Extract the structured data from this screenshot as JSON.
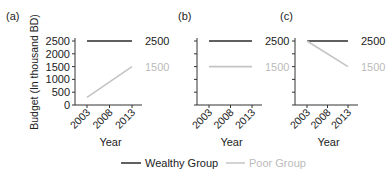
{
  "figure": {
    "ylabel": "Budget (In thousand BD)",
    "xlabel": "Year",
    "legend": {
      "items": [
        {
          "label": "Wealthy Group",
          "color": "#2b2b2b"
        },
        {
          "label": "Poor Group",
          "color": "#c4c4c4"
        }
      ]
    }
  },
  "chart_data": [
    {
      "type": "line",
      "panel_label": "(a)",
      "x": [
        2003,
        2008,
        2013
      ],
      "xticks": [
        "2003",
        "2008",
        "2013"
      ],
      "xlabel": "Year",
      "ylabel": "Budget (In thousand BD)",
      "yticks": [
        "0",
        "500",
        "1000",
        "1500",
        "2000",
        "2500"
      ],
      "ylim": [
        0,
        2500
      ],
      "series": [
        {
          "name": "Wealthy Group",
          "color": "#2b2b2b",
          "x": [
            2003,
            2013
          ],
          "values": [
            2500,
            2500
          ],
          "end_label": "2500"
        },
        {
          "name": "Poor Group",
          "color": "#c4c4c4",
          "x": [
            2003,
            2013
          ],
          "values": [
            300,
            1500
          ],
          "end_label": "1500"
        }
      ],
      "grid": false
    },
    {
      "type": "line",
      "panel_label": "(b)",
      "x": [
        2003,
        2008,
        2013
      ],
      "xticks": [
        "2003",
        "2008",
        "2013"
      ],
      "xlabel": "Year",
      "ylim": [
        0,
        2500
      ],
      "series": [
        {
          "name": "Wealthy Group",
          "color": "#2b2b2b",
          "x": [
            2003,
            2013
          ],
          "values": [
            2500,
            2500
          ],
          "end_label": "2500"
        },
        {
          "name": "Poor Group",
          "color": "#c4c4c4",
          "x": [
            2003,
            2013
          ],
          "values": [
            1500,
            1500
          ],
          "end_label": "1500"
        }
      ],
      "grid": false
    },
    {
      "type": "line",
      "panel_label": "(c)",
      "x": [
        2003,
        2008,
        2013
      ],
      "xticks": [
        "2003",
        "2008",
        "2013"
      ],
      "xlabel": "Year",
      "ylim": [
        0,
        2500
      ],
      "series": [
        {
          "name": "Wealthy Group",
          "color": "#2b2b2b",
          "x": [
            2003,
            2013
          ],
          "values": [
            2500,
            2500
          ],
          "end_label": "2500"
        },
        {
          "name": "Poor Group",
          "color": "#c4c4c4",
          "x": [
            2003,
            2013
          ],
          "values": [
            2500,
            1500
          ],
          "end_label": "1500"
        }
      ],
      "grid": false
    }
  ]
}
